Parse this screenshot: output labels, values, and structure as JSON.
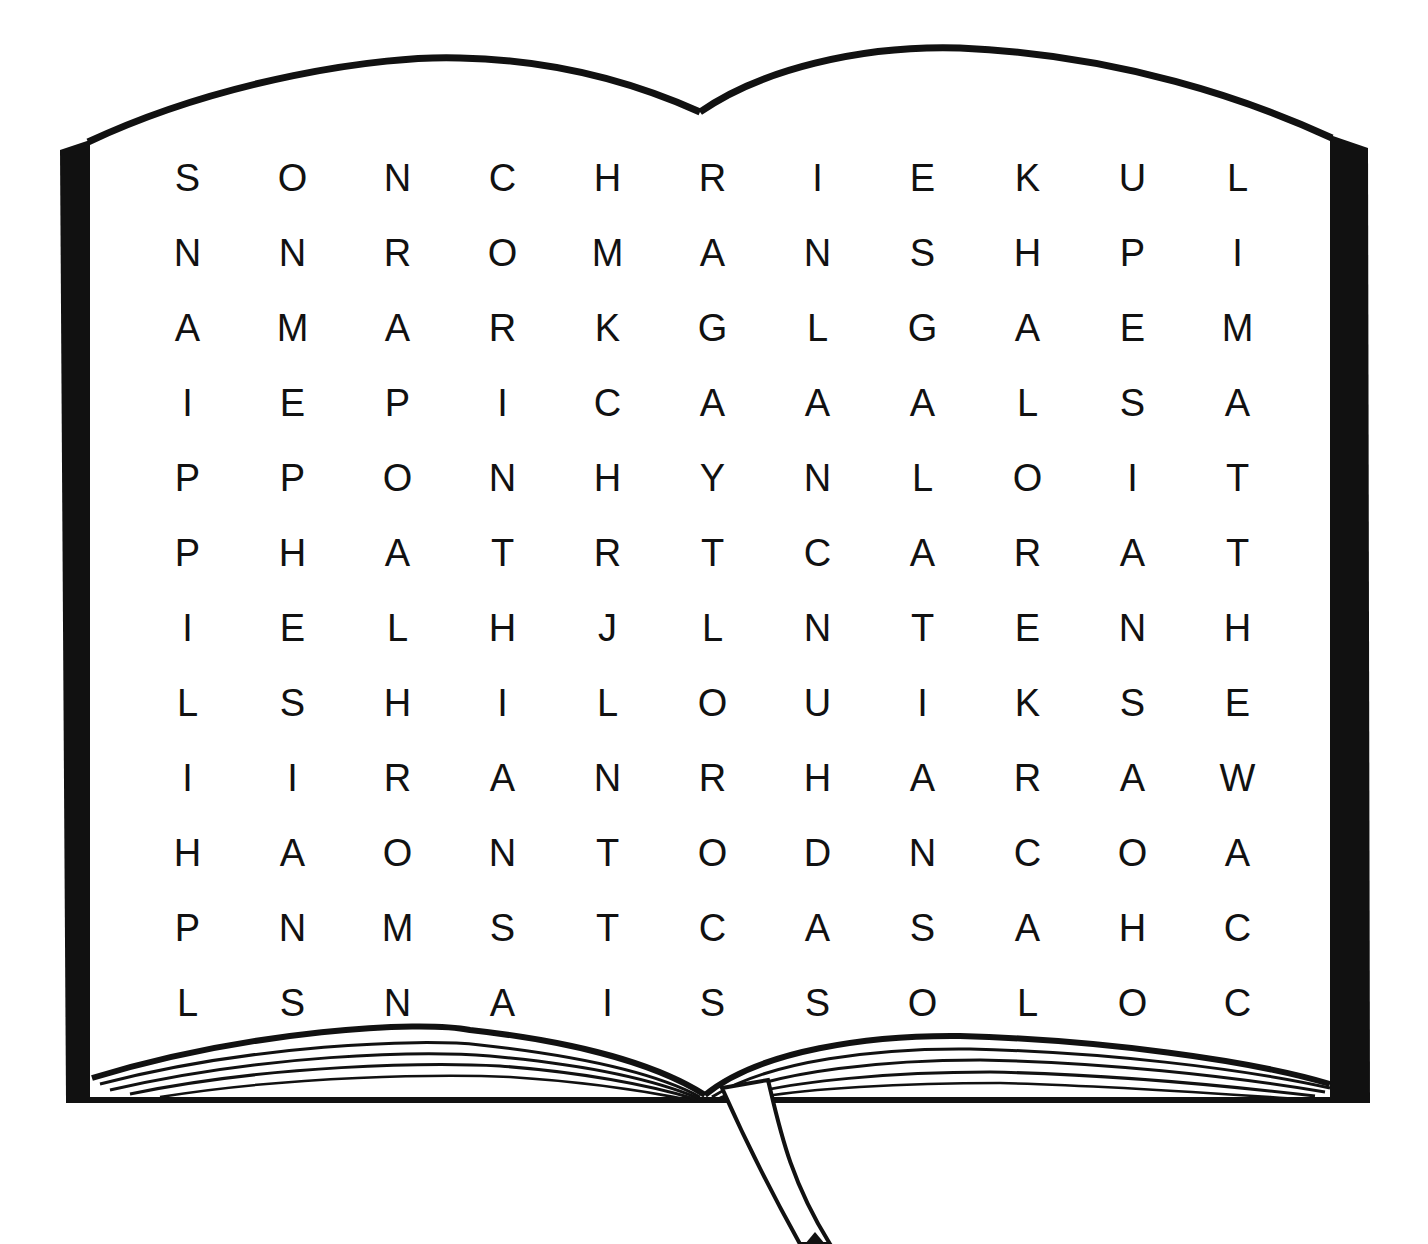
{
  "puzzle": {
    "type": "word-search",
    "rows": 12,
    "cols": 12,
    "grid": [
      [
        "S",
        "O",
        "N",
        "C",
        "H",
        "R",
        "I",
        "E",
        "K",
        "U",
        "L"
      ],
      [
        "N",
        "N",
        "R",
        "O",
        "M",
        "A",
        "N",
        "S",
        "H",
        "P",
        "I"
      ],
      [
        "A",
        "M",
        "A",
        "R",
        "K",
        "G",
        "L",
        "G",
        "A",
        "E",
        "M"
      ],
      [
        "I",
        "E",
        "P",
        "I",
        "C",
        "A",
        "A",
        "A",
        "L",
        "S",
        "A"
      ],
      [
        "P",
        "P",
        "O",
        "N",
        "H",
        "Y",
        "N",
        "L",
        "O",
        "I",
        "T"
      ],
      [
        "P",
        "H",
        "A",
        "T",
        "R",
        "T",
        "C",
        "A",
        "R",
        "A",
        "T"
      ],
      [
        "I",
        "E",
        "L",
        "H",
        "J",
        "L",
        "N",
        "T",
        "E",
        "N",
        "H"
      ],
      [
        "L",
        "S",
        "H",
        "I",
        "L",
        "O",
        "U",
        "I",
        "K",
        "S",
        "E"
      ],
      [
        "I",
        "I",
        "R",
        "A",
        "N",
        "R",
        "H",
        "A",
        "R",
        "A",
        "W"
      ],
      [
        "H",
        "A",
        "O",
        "N",
        "T",
        "O",
        "D",
        "N",
        "C",
        "O",
        "A"
      ],
      [
        "P",
        "N",
        "M",
        "S",
        "T",
        "C",
        "A",
        "S",
        "A",
        "H",
        "C"
      ],
      [
        "L",
        "S",
        "N",
        "A",
        "I",
        "S",
        "S",
        "O",
        "L",
        "O",
        "C"
      ]
    ]
  },
  "illustration": {
    "subject": "open-book",
    "has_bookmark_ribbon": true,
    "ink_color": "#111111",
    "page_color": "#ffffff"
  }
}
